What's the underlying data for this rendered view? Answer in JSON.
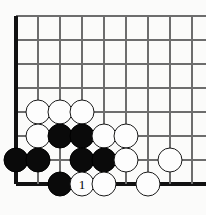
{
  "diagram": {
    "kind": "go-board-corner-diagram",
    "width": 206,
    "height": 215,
    "background_color": "#fbfbfa"
  },
  "board": {
    "line_color": "#6d6d6d",
    "edge_color": "#111111",
    "origin_x": 16,
    "origin_y": 16,
    "spacing_x": 22,
    "spacing_y": 24,
    "columns": 9,
    "rows": 8,
    "vertical_line_x": [
      16,
      38,
      60,
      82,
      104,
      126,
      148,
      170,
      192
    ],
    "horizontal_line_y": [
      16,
      40,
      64,
      88,
      112,
      136,
      160,
      184
    ],
    "edges": [
      {
        "name": "left-board-edge",
        "orientation": "v",
        "x": 16
      },
      {
        "name": "bottom-board-edge",
        "orientation": "h",
        "y": 184
      }
    ]
  },
  "stones": {
    "black_color": "#0a0a0a",
    "white_color": "#fdfdfd",
    "radius": 12.5,
    "items": [
      {
        "name": "white-stone-b6",
        "color": "white",
        "x": 38,
        "y": 112,
        "label": ""
      },
      {
        "name": "white-stone-c6",
        "color": "white",
        "x": 60,
        "y": 112,
        "label": ""
      },
      {
        "name": "white-stone-d6",
        "color": "white",
        "x": 82,
        "y": 112,
        "label": ""
      },
      {
        "name": "white-stone-b5",
        "color": "white",
        "x": 38,
        "y": 136,
        "label": ""
      },
      {
        "name": "black-stone-c5",
        "color": "black",
        "x": 60,
        "y": 136,
        "label": ""
      },
      {
        "name": "black-stone-d5",
        "color": "black",
        "x": 82,
        "y": 136,
        "label": ""
      },
      {
        "name": "white-stone-e5",
        "color": "white",
        "x": 104,
        "y": 136,
        "label": ""
      },
      {
        "name": "white-stone-f5",
        "color": "white",
        "x": 126,
        "y": 136,
        "label": ""
      },
      {
        "name": "black-stone-a4",
        "color": "black",
        "x": 16,
        "y": 160,
        "label": ""
      },
      {
        "name": "black-stone-b4",
        "color": "black",
        "x": 38,
        "y": 160,
        "label": ""
      },
      {
        "name": "black-stone-d4",
        "color": "black",
        "x": 82,
        "y": 160,
        "label": ""
      },
      {
        "name": "black-stone-e4",
        "color": "black",
        "x": 104,
        "y": 160,
        "label": ""
      },
      {
        "name": "white-stone-f4",
        "color": "white",
        "x": 126,
        "y": 160,
        "label": ""
      },
      {
        "name": "white-stone-h4",
        "color": "white",
        "x": 170,
        "y": 160,
        "label": ""
      },
      {
        "name": "black-stone-c3",
        "color": "black",
        "x": 60,
        "y": 184,
        "label": ""
      },
      {
        "name": "white-stone-move-1",
        "color": "white",
        "x": 82,
        "y": 184,
        "label": "1"
      },
      {
        "name": "white-stone-e3",
        "color": "white",
        "x": 104,
        "y": 184,
        "label": ""
      },
      {
        "name": "white-stone-g3",
        "color": "white",
        "x": 148,
        "y": 184,
        "label": ""
      }
    ]
  }
}
